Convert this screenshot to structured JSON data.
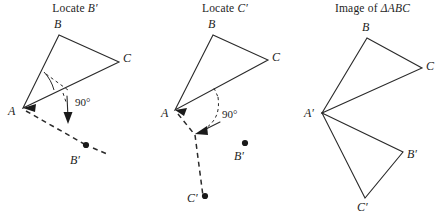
{
  "figure": {
    "type": "geometry-construction-diagram",
    "background_color": "#ffffff",
    "ink_color": "#2a2a2a"
  },
  "panels": [
    {
      "id": "locate-b-prime",
      "title_prefix": "Locate ",
      "title_symbol": "B′",
      "title_full": "Locate B′",
      "angle_label": "90°",
      "vertex_labels": {
        "a": "A",
        "b": "B",
        "c": "C",
        "b_prime": "B′"
      },
      "points": {
        "A": [
          23,
          108
        ],
        "B": [
          59,
          35
        ],
        "C": [
          119,
          62
        ],
        "B_prime": [
          86,
          145
        ]
      }
    },
    {
      "id": "locate-c-prime",
      "title_prefix": "Locate ",
      "title_symbol": "C′",
      "title_full": "Locate C′",
      "angle_label": "90°",
      "vertex_labels": {
        "a": "A",
        "b": "B",
        "c": "C",
        "b_prime": "B′",
        "c_prime": "C′"
      },
      "points": {
        "A": [
          25,
          110
        ],
        "B": [
          63,
          35
        ],
        "C": [
          118,
          60
        ],
        "B_prime": [
          95,
          148
        ],
        "C_prime": [
          53,
          196
        ]
      }
    },
    {
      "id": "image-of-triangle-abc",
      "title_prefix": "Image of ",
      "title_symbol": "ΔABC",
      "title_full": "Image of ΔABC",
      "vertex_labels": {
        "a_prime": "A′",
        "b": "B",
        "c": "C",
        "b_prime": "B′",
        "c_prime": "C′"
      },
      "points": {
        "A_prime": [
          22,
          113
        ],
        "B": [
          67,
          38
        ],
        "C": [
          122,
          68
        ],
        "B_prime": [
          103,
          152
        ],
        "C_prime": [
          65,
          198
        ]
      }
    }
  ]
}
